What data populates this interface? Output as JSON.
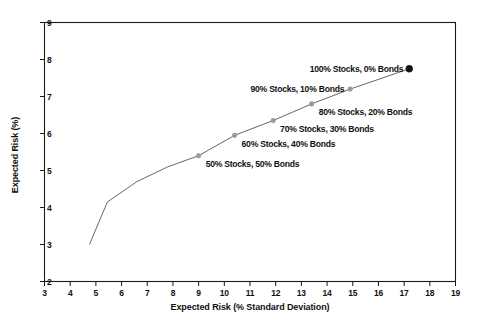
{
  "chart_data": {
    "type": "line",
    "title": "",
    "xlabel": "Expected Risk (% Standard Deviation)",
    "ylabel": "Expected Risk (%)",
    "xlim": [
      3,
      19
    ],
    "ylim": [
      2,
      9
    ],
    "xticks": [
      3,
      4,
      5,
      6,
      7,
      8,
      9,
      10,
      11,
      12,
      13,
      14,
      15,
      16,
      17,
      18,
      19
    ],
    "yticks": [
      2,
      3,
      4,
      5,
      6,
      7,
      8,
      9
    ],
    "grid": false,
    "legend": "none",
    "series": [
      {
        "name": "Efficient frontier",
        "x": [
          4.75,
          5.45,
          6.6,
          7.8,
          9.0,
          10.4,
          11.9,
          13.4,
          14.9,
          17.2
        ],
        "y": [
          3.0,
          4.15,
          4.7,
          5.1,
          5.4,
          5.95,
          6.35,
          6.8,
          7.2,
          7.75
        ]
      }
    ],
    "points": [
      {
        "label": "50% Stocks, 50% Bonds",
        "x": 9.0,
        "y": 5.4,
        "label_side": "right",
        "marker": "open"
      },
      {
        "label": "60% Stocks, 40% Bonds",
        "x": 10.4,
        "y": 5.95,
        "label_side": "right",
        "marker": "open"
      },
      {
        "label": "70% Stocks, 30% Bonds",
        "x": 11.9,
        "y": 6.35,
        "label_side": "right",
        "marker": "open"
      },
      {
        "label": "80% Stocks, 20% Bonds",
        "x": 13.4,
        "y": 6.8,
        "label_side": "right",
        "marker": "open"
      },
      {
        "label": "90% Stocks, 10% Bonds",
        "x": 14.9,
        "y": 7.2,
        "label_side": "left",
        "marker": "open"
      },
      {
        "label": "100% Stocks, 0% Bonds",
        "x": 17.2,
        "y": 7.75,
        "label_side": "left",
        "marker": "filled"
      }
    ],
    "colors": {
      "line": "#555555",
      "axis": "#1a1a1a",
      "marker_filled": "#111111",
      "marker_open": "#9a9a9a",
      "background": "#ffffff",
      "text": "#111111"
    }
  }
}
